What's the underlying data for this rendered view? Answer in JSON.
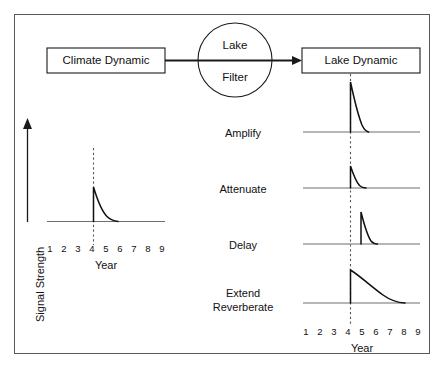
{
  "diagram": {
    "title_nodes": {
      "source_box": "Climate Dynamic",
      "filter_circle_line1": "Lake",
      "filter_circle_line2": "Filter",
      "target_box": "Lake Dynamic"
    },
    "axis": {
      "y_label": "Signal Strength",
      "x_label_left": "Year",
      "x_label_right": "Year",
      "tick_labels": [
        "1",
        "2",
        "3",
        "4",
        "5",
        "6",
        "7",
        "8",
        "9"
      ]
    },
    "process_labels": [
      {
        "id": "amplify",
        "text": "Amplify"
      },
      {
        "id": "attenuate",
        "text": "Attenuate"
      },
      {
        "id": "delay",
        "text": "Delay"
      },
      {
        "id": "extend-reverberate-1",
        "text": "Extend"
      },
      {
        "id": "extend-reverberate-2",
        "text": "Reverberate"
      }
    ],
    "colors": {
      "frame": "#58585e",
      "line": "#111111",
      "baseline": "#6f6f6f",
      "dashed": "#555555",
      "background": "#ffffff"
    }
  },
  "chart_data": {
    "type": "line",
    "xlabel": "Year",
    "ylabel": "Signal Strength",
    "x": [
      1,
      2,
      3,
      4,
      5,
      6,
      7,
      8,
      9
    ],
    "xlim": [
      1,
      9
    ],
    "grid": false,
    "legend": "none",
    "event_year": 4,
    "panels": [
      {
        "name": "Climate Dynamic (input signal)",
        "position": "left",
        "peak_year": 4,
        "peak_amplitude": 1.0,
        "decay_end_year": 5.6,
        "values": [
          0,
          0,
          0,
          1.0,
          0.22,
          0.02,
          0,
          0,
          0
        ]
      },
      {
        "name": "Amplify",
        "position": "right",
        "peak_year": 4,
        "peak_amplitude": 2.0,
        "decay_end_year": 5.3,
        "values": [
          0,
          0,
          0,
          2.0,
          0.35,
          0.0,
          0,
          0,
          0
        ]
      },
      {
        "name": "Attenuate",
        "position": "right",
        "peak_year": 4,
        "peak_amplitude": 0.45,
        "decay_end_year": 5.3,
        "values": [
          0,
          0,
          0,
          0.45,
          0.08,
          0.0,
          0,
          0,
          0
        ]
      },
      {
        "name": "Delay",
        "position": "right",
        "peak_year": 5,
        "peak_amplitude": 1.3,
        "decay_end_year": 6.2,
        "values": [
          0,
          0,
          0,
          0,
          1.3,
          0.18,
          0,
          0,
          0
        ]
      },
      {
        "name": "Extend Reverberate",
        "position": "right",
        "peak_year": 4,
        "peak_amplitude": 1.35,
        "decay_end_year": 8.0,
        "values": [
          0,
          0,
          0,
          1.35,
          0.95,
          0.6,
          0.34,
          0.12,
          0.0
        ]
      }
    ]
  }
}
